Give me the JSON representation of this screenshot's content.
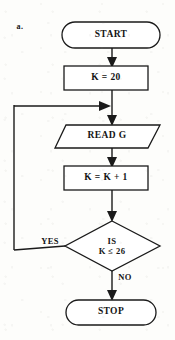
{
  "page": {
    "item_label": "a.",
    "background_color": "#fdfdfb",
    "ink_color": "#1a1a1a"
  },
  "flowchart": {
    "type": "flowchart",
    "title": "",
    "nodes": [
      {
        "id": "start",
        "shape": "terminal",
        "label": "START",
        "cx": 111,
        "cy": 35,
        "width": 98,
        "height": 26
      },
      {
        "id": "init",
        "shape": "process",
        "label": "K = 20",
        "cx": 106,
        "cy": 78,
        "width": 84,
        "height": 24
      },
      {
        "id": "read",
        "shape": "input-output",
        "label": "READ G",
        "cx": 107,
        "cy": 136,
        "width": 105,
        "height": 23
      },
      {
        "id": "increment",
        "shape": "process",
        "label": "K = K + 1",
        "cx": 106,
        "cy": 178,
        "width": 84,
        "height": 24
      },
      {
        "id": "decision",
        "shape": "decision",
        "label_line1": "IS",
        "label_line2": "K ≤ 26",
        "cx": 112,
        "cy": 246,
        "width": 95,
        "height": 50
      },
      {
        "id": "stop",
        "shape": "terminal",
        "label": "STOP",
        "cx": 111,
        "cy": 312,
        "width": 90,
        "height": 25
      }
    ],
    "edges": [
      {
        "id": "start-to-init",
        "from": "start",
        "to": "init",
        "label": ""
      },
      {
        "id": "init-to-merge",
        "from": "init",
        "to": "read",
        "label": ""
      },
      {
        "id": "read-to-increment",
        "from": "read",
        "to": "increment",
        "label": ""
      },
      {
        "id": "increment-to-decision",
        "from": "increment",
        "to": "decision",
        "label": ""
      },
      {
        "id": "decision-yes-loop",
        "from": "decision",
        "to": "read",
        "label": "YES",
        "label_cx": 50,
        "label_cy": 241
      },
      {
        "id": "decision-no-to-stop",
        "from": "decision",
        "to": "stop",
        "label": "NO",
        "label_cx": 125,
        "label_cy": 277
      }
    ]
  }
}
